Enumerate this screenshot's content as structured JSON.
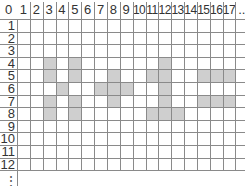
{
  "grid": {
    "column_labels": [
      "0",
      "1",
      "2",
      "3",
      "4",
      "5",
      "6",
      "7",
      "8",
      "9",
      "10",
      "11",
      "12",
      "13",
      "14",
      "15",
      "16",
      "17",
      ".."
    ],
    "row_labels": [
      "1",
      "2",
      "3",
      "4",
      "5",
      "6",
      "7",
      "8",
      "9",
      "10",
      "11",
      "12"
    ],
    "continuation_marker": "⋮",
    "shade_color": "#cfcfcf",
    "shaded_cells": [
      {
        "row": 4,
        "col": 3
      },
      {
        "row": 4,
        "col": 5
      },
      {
        "row": 4,
        "col": 12
      },
      {
        "row": 5,
        "col": 3
      },
      {
        "row": 5,
        "col": 5
      },
      {
        "row": 5,
        "col": 8
      },
      {
        "row": 5,
        "col": 11
      },
      {
        "row": 5,
        "col": 12
      },
      {
        "row": 5,
        "col": 15
      },
      {
        "row": 5,
        "col": 16
      },
      {
        "row": 5,
        "col": 17
      },
      {
        "row": 6,
        "col": 4
      },
      {
        "row": 6,
        "col": 7
      },
      {
        "row": 6,
        "col": 8
      },
      {
        "row": 6,
        "col": 9
      },
      {
        "row": 6,
        "col": 12
      },
      {
        "row": 7,
        "col": 3
      },
      {
        "row": 7,
        "col": 5
      },
      {
        "row": 7,
        "col": 8
      },
      {
        "row": 7,
        "col": 12
      },
      {
        "row": 7,
        "col": 15
      },
      {
        "row": 7,
        "col": 16
      },
      {
        "row": 7,
        "col": 17
      },
      {
        "row": 8,
        "col": 3
      },
      {
        "row": 8,
        "col": 5
      },
      {
        "row": 8,
        "col": 11
      },
      {
        "row": 8,
        "col": 12
      },
      {
        "row": 8,
        "col": 13
      }
    ]
  }
}
